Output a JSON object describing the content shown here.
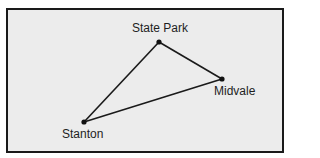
{
  "diagram": {
    "towns": [
      {
        "name": "State Park",
        "x": 159,
        "y": 42,
        "label_x": 132,
        "label_y": 21
      },
      {
        "name": "Midvale",
        "x": 222,
        "y": 79,
        "label_x": 214,
        "label_y": 84
      },
      {
        "name": "Stanton",
        "x": 84,
        "y": 122,
        "label_x": 62,
        "label_y": 127
      }
    ],
    "roads": [
      [
        "State Park",
        "Midvale"
      ],
      [
        "Midvale",
        "Stanton"
      ],
      [
        "Stanton",
        "State Park"
      ]
    ],
    "colors": {
      "background": "#ececec",
      "line": "#1a1a1a",
      "border": "#1a1a1a"
    }
  }
}
